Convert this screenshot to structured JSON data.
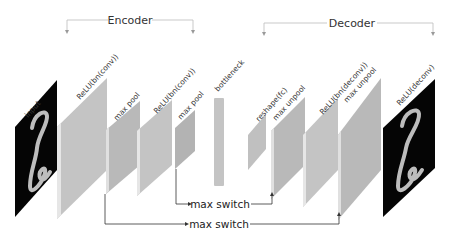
{
  "diagram": {
    "type": "convolutional autoencoder architecture",
    "colors": {
      "layer_fill": "#c4c4c4",
      "layer_fill_dark": "#b3b3b3",
      "layer_edge": "#e6e6e6",
      "image_bg": "#000000",
      "digit_stroke": "#bdbdbd",
      "bracket": "#bbbbbb",
      "arrow": "#333333"
    },
    "groups": {
      "encoder": {
        "label": "Encoder"
      },
      "decoder": {
        "label": "Decoder"
      }
    },
    "layers": [
      {
        "id": "input",
        "label": "input",
        "kind": "image"
      },
      {
        "id": "enc_conv1",
        "label": "ReLU(bn(conv))",
        "kind": "feature"
      },
      {
        "id": "enc_pool1",
        "label": "max pool",
        "kind": "feature"
      },
      {
        "id": "enc_conv2",
        "label": "ReLU(bn(conv))",
        "kind": "feature"
      },
      {
        "id": "enc_pool2",
        "label": "max pool",
        "kind": "feature"
      },
      {
        "id": "bottleneck",
        "label": "bottleneck",
        "kind": "vector"
      },
      {
        "id": "dec_reshape",
        "label": "reshape(fc)",
        "kind": "feature"
      },
      {
        "id": "dec_unpool1",
        "label": "max unpool",
        "kind": "feature"
      },
      {
        "id": "dec_deconv1",
        "label": "ReLU(bn(deconv))",
        "kind": "feature"
      },
      {
        "id": "dec_unpool2",
        "label": "max unpool",
        "kind": "feature"
      },
      {
        "id": "output",
        "label": "ReLU(deconv)",
        "kind": "image"
      }
    ],
    "connections": [
      {
        "from": "enc_pool2",
        "to": "dec_unpool1",
        "label": "max switch"
      },
      {
        "from": "enc_pool1",
        "to": "dec_unpool2",
        "label": "max switch"
      }
    ]
  }
}
